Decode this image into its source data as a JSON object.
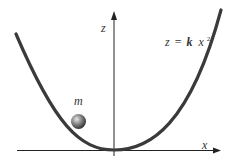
{
  "diagram": {
    "axes": {
      "z_label": "z",
      "x_label": "x"
    },
    "equation": {
      "lhs": "z",
      "eq": "=",
      "k": "k",
      "x": "x",
      "exp": "2"
    },
    "mass": {
      "label": "m"
    },
    "colors": {
      "curve": "#3a3a3a",
      "axis": "#222222",
      "ball_highlight": "#cfcfcf",
      "ball_shadow": "#2a2a2a"
    }
  }
}
